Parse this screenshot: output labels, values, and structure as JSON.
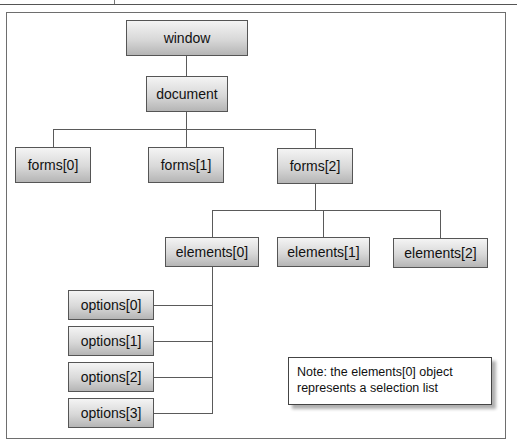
{
  "diagram": {
    "nodes": {
      "window": "window",
      "document": "document",
      "forms0": "forms[0]",
      "forms1": "forms[1]",
      "forms2": "forms[2]",
      "elements0": "elements[0]",
      "elements1": "elements[1]",
      "elements2": "elements[2]",
      "options0": "options[0]",
      "options1": "options[1]",
      "options2": "options[2]",
      "options3": "options[3]"
    },
    "note": {
      "line1": "Note: the elements[0] object",
      "line2": "represents a selection list"
    },
    "colors": {
      "node_top": "#f4f4f4",
      "node_bottom": "#b5b5b5",
      "connector": "#5a5a5a",
      "border": "#555555"
    }
  }
}
